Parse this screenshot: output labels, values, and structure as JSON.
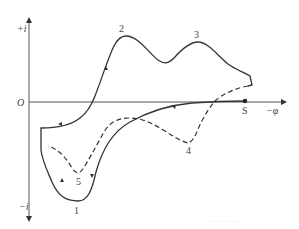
{
  "diagram": {
    "type": "cyclic-voltammogram",
    "axes": {
      "y_positive_label": "+i",
      "y_negative_label": "−i",
      "origin_label": "O",
      "x_label": "−φ"
    },
    "start_point_label": "S",
    "peak_labels": [
      "1",
      "2",
      "3",
      "4",
      "5"
    ],
    "curves": [
      {
        "name": "solid-curve",
        "style": "solid",
        "color": "#333333",
        "peaks": [
          "1",
          "2",
          "3"
        ]
      },
      {
        "name": "dashed-curve",
        "style": "dashed",
        "color": "#333333",
        "peaks": [
          "4",
          "5"
        ]
      }
    ],
    "footer_faint_text": "·· ·· · ··· ··"
  }
}
